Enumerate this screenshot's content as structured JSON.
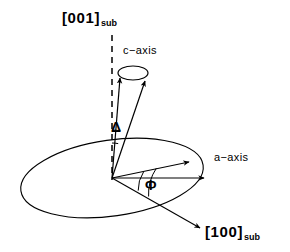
{
  "figure": {
    "background_color": "#ffffff",
    "line_color": "#000000",
    "width": 290,
    "height": 252
  },
  "labels": {
    "substrate_normal": {
      "text": "[001]",
      "subscript": "sub",
      "name": "substrate-normal-label"
    },
    "c_axis": {
      "text": "c−axis",
      "name": "c-axis-label"
    },
    "a_axis": {
      "text": "a−axis",
      "name": "a-axis-label"
    },
    "substrate_inplane": {
      "text": "[100]",
      "subscript": "sub",
      "name": "substrate-inplane-label"
    },
    "tilt_angle": {
      "text": "Δ",
      "name": "delta-angle-label"
    },
    "azimuth_angle": {
      "text": "Φ",
      "name": "phi-angle-label"
    }
  },
  "geometry": {
    "origin": {
      "x": 112,
      "y": 178
    },
    "basal_plane_ellipse": {
      "cx": 112,
      "cy": 178,
      "rx": 92,
      "ry": 38,
      "rotation_deg": -8
    },
    "dashed_axis": {
      "x": 112,
      "y_top": 35,
      "y_bottom": 180,
      "dash_pattern": "6 5"
    },
    "cone_top_ellipse": {
      "cx": 133,
      "cy": 73,
      "rx": 15,
      "ry": 7,
      "rotation_deg": 0
    },
    "c_axis_vectors": [
      {
        "x1": 112,
        "y1": 178,
        "x2": 120,
        "y2": 76,
        "name": "c-axis-left-vector"
      },
      {
        "x1": 112,
        "y1": 178,
        "x2": 146,
        "y2": 79,
        "name": "c-axis-right-vector"
      }
    ],
    "a_axis_vectors": [
      {
        "x1": 112,
        "y1": 178,
        "x2": 191,
        "y2": 162,
        "name": "a-axis-upper-vector"
      },
      {
        "x1": 112,
        "y1": 178,
        "x2": 205,
        "y2": 178,
        "name": "a-axis-lower-vector"
      }
    ],
    "inplane_vector": {
      "x1": 112,
      "y1": 178,
      "x2": 201,
      "y2": 229,
      "name": "substrate-inplane-vector"
    },
    "delta_arc": {
      "cx": 112,
      "cy": 178,
      "r": 48,
      "start_deg": -90,
      "end_deg": -80
    },
    "phi_arc": {
      "cx": 112,
      "cy": 178,
      "r": 48,
      "start_deg": -11,
      "end_deg": 30
    }
  }
}
